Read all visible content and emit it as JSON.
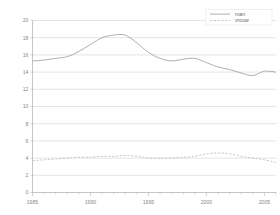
{
  "chart_data": {
    "type": "line",
    "title": "",
    "subtitle": "",
    "xlabel": "",
    "ylabel": "",
    "xlim": [
      1985,
      2006
    ],
    "ylim": [
      0,
      20
    ],
    "ytick_step": 2,
    "grid": true,
    "legend_position": "top-right",
    "x_tick_labels": [
      "1985",
      "1990",
      "1995",
      "2000",
      "2005"
    ],
    "x_tick_values": [
      1985,
      1990,
      1995,
      2000,
      2005
    ],
    "y_tick_labels": [
      "0",
      "2",
      "4",
      "6",
      "8",
      "10",
      "12",
      "14",
      "16",
      "18",
      "20"
    ],
    "y_tick_values": [
      0,
      2,
      4,
      6,
      8,
      10,
      12,
      14,
      16,
      18,
      20
    ],
    "x": [
      1985,
      1986,
      1987,
      1988,
      1989,
      1990,
      1991,
      1992,
      1993,
      1994,
      1995,
      1996,
      1997,
      1998,
      1999,
      2000,
      2001,
      2002,
      2003,
      2004,
      2005,
      2006
    ],
    "series": [
      {
        "name": "man",
        "style": "solid",
        "color": "#9a9a9a",
        "values": [
          15.3,
          15.4,
          15.6,
          15.8,
          16.4,
          17.2,
          18.0,
          18.3,
          18.3,
          17.4,
          16.3,
          15.6,
          15.3,
          15.5,
          15.6,
          15.1,
          14.6,
          14.3,
          13.9,
          13.6,
          14.1,
          14.0
        ]
      },
      {
        "name": "vrouw",
        "style": "dashed",
        "color": "#b0b0b0",
        "values": [
          3.7,
          3.8,
          3.9,
          4.0,
          4.1,
          4.1,
          4.2,
          4.2,
          4.3,
          4.2,
          4.0,
          4.0,
          4.0,
          4.1,
          4.2,
          4.5,
          4.6,
          4.5,
          4.2,
          4.0,
          3.8,
          3.5
        ]
      }
    ]
  },
  "legend": {
    "entries": [
      {
        "label": "man"
      },
      {
        "label": "vrouw"
      }
    ]
  }
}
